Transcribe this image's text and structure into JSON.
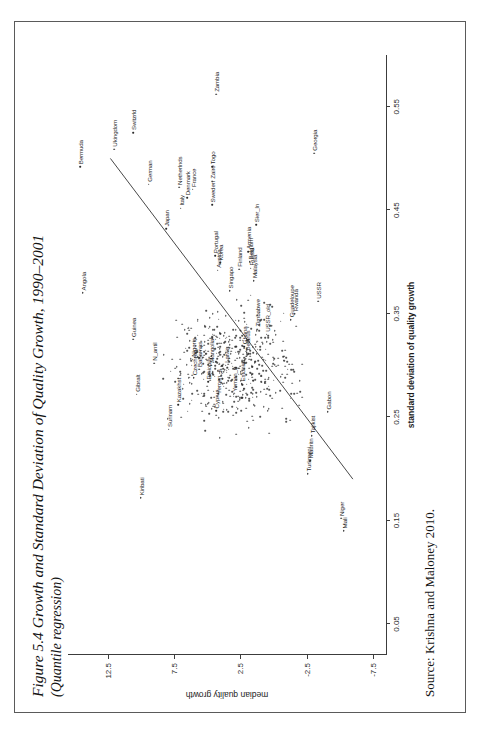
{
  "figure": {
    "title": "Figure 5.4 Growth and Standard Deviation of Quality Growth, 1990–2001",
    "subtitle": "(Quantile regression)",
    "source": "Source: Krishna and Maloney 2010."
  },
  "chart_data": {
    "type": "scatter",
    "title": "Figure 5.4 Growth and Standard Deviation of Quality Growth, 1990–2001",
    "subtitle": "(Quantile regression)",
    "xlabel": "standard deviation of quality growth",
    "ylabel": "median quality growth",
    "xlim": [
      0.02,
      0.6
    ],
    "ylim": [
      -8.5,
      15.5
    ],
    "xticks": [
      "0.05",
      "0.15",
      "0.25",
      "0.35",
      "0.45",
      "0.55"
    ],
    "xtickvals": [
      0.05,
      0.15,
      0.25,
      0.35,
      0.45,
      0.55
    ],
    "yticks": [
      "12.5",
      "7.5",
      "2.5",
      "-2.5",
      "-7.5"
    ],
    "ytickvals": [
      12.5,
      7.5,
      2.5,
      -2.5,
      -7.5
    ],
    "grid": false,
    "legend": null,
    "marker": "dot-with-text-label",
    "fit_line": {
      "type": "quantile-regression",
      "x": [
        0.19,
        0.5
      ],
      "y": [
        -6.0,
        12.3
      ]
    },
    "points": [
      {
        "label": "Bermuda",
        "x": 0.492,
        "y": 14.6
      },
      {
        "label": "Angola",
        "x": 0.37,
        "y": 14.4
      },
      {
        "label": "Guinea",
        "x": 0.325,
        "y": 10.6
      },
      {
        "label": "Gibralt",
        "x": 0.272,
        "y": 10.3
      },
      {
        "label": "N_antil",
        "x": 0.302,
        "y": 9.0
      },
      {
        "label": "Kiribati",
        "x": 0.172,
        "y": 10.0
      },
      {
        "label": "Ukingdom",
        "x": 0.509,
        "y": 12.0
      },
      {
        "label": "Switzrld",
        "x": 0.525,
        "y": 10.6
      },
      {
        "label": "German",
        "x": 0.475,
        "y": 9.4
      },
      {
        "label": "Japan",
        "x": 0.432,
        "y": 8.1
      },
      {
        "label": "Italy",
        "x": 0.452,
        "y": 7.0
      },
      {
        "label": "Netherlnds",
        "x": 0.472,
        "y": 7.1
      },
      {
        "label": "Denmark",
        "x": 0.462,
        "y": 6.5
      },
      {
        "label": "France",
        "x": 0.47,
        "y": 6.1
      },
      {
        "label": "Sweden",
        "x": 0.455,
        "y": 4.6
      },
      {
        "label": "Zaire",
        "x": 0.478,
        "y": 4.6
      },
      {
        "label": "Togo",
        "x": 0.492,
        "y": 4.6
      },
      {
        "label": "Zambia",
        "x": 0.562,
        "y": 4.3
      },
      {
        "label": "Armenia",
        "x": 0.41,
        "y": 1.9
      },
      {
        "label": "Sier_ln",
        "x": 0.436,
        "y": 1.3
      },
      {
        "label": "Georgia",
        "x": 0.505,
        "y": -3.1
      },
      {
        "label": "USSR",
        "x": 0.362,
        "y": -3.4
      },
      {
        "label": "Gabon",
        "x": 0.255,
        "y": -4.1
      },
      {
        "label": "Niger",
        "x": 0.152,
        "y": -5.1
      },
      {
        "label": "Mali",
        "x": 0.14,
        "y": -5.3
      },
      {
        "label": "Turkmeni",
        "x": 0.195,
        "y": -2.6
      },
      {
        "label": "Mauritn",
        "x": 0.208,
        "y": -2.8
      },
      {
        "label": "Tajikist",
        "x": 0.232,
        "y": -2.9
      },
      {
        "label": "Surinam",
        "x": 0.238,
        "y": 7.9
      },
      {
        "label": "Kazakhst",
        "x": 0.262,
        "y": 7.2
      },
      {
        "label": "Czechrep",
        "x": 0.288,
        "y": 6.0
      },
      {
        "label": "Nigeria",
        "x": 0.306,
        "y": 6.1
      },
      {
        "label": "Bahamas",
        "x": 0.296,
        "y": 5.6
      },
      {
        "label": "Cyprus",
        "x": 0.256,
        "y": 4.3
      },
      {
        "label": "Ethiopia",
        "x": 0.284,
        "y": 4.9
      },
      {
        "label": "Mongolia",
        "x": 0.3,
        "y": 4.7
      },
      {
        "label": "Yemen_s",
        "x": 0.27,
        "y": 4.2
      },
      {
        "label": "Yemen_n",
        "x": 0.272,
        "y": 3.0
      },
      {
        "label": "Latvia",
        "x": 0.3,
        "y": 3.6
      },
      {
        "label": "Singapo",
        "x": 0.372,
        "y": 3.3
      },
      {
        "label": "Austria",
        "x": 0.392,
        "y": 4.2
      },
      {
        "label": "Korea",
        "x": 0.399,
        "y": 4.0
      },
      {
        "label": "Portugal",
        "x": 0.406,
        "y": 4.4
      },
      {
        "label": "Finland",
        "x": 0.393,
        "y": 2.6
      },
      {
        "label": "Belgium",
        "x": 0.4,
        "y": 1.8
      },
      {
        "label": "Russia",
        "x": 0.394,
        "y": 1.7
      },
      {
        "label": "Malaysia",
        "x": 0.382,
        "y": 1.5
      },
      {
        "label": "Zimbabwe",
        "x": 0.335,
        "y": 1.2
      },
      {
        "label": "USSR_old",
        "x": 0.33,
        "y": 0.5
      },
      {
        "label": "Ghana",
        "x": 0.318,
        "y": 2.2
      },
      {
        "label": "Belarus",
        "x": 0.312,
        "y": 2.0
      },
      {
        "label": "Guadeloupe",
        "x": 0.344,
        "y": -1.3
      },
      {
        "label": "Rwanda",
        "x": 0.35,
        "y": -1.6
      },
      {
        "label": "Estonia",
        "x": 0.282,
        "y": 2.4
      }
    ]
  }
}
